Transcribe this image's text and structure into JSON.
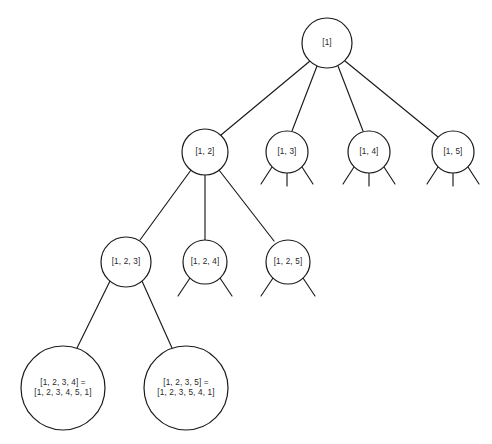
{
  "figure": {
    "type": "tree-diagram",
    "background_color": "#ffffff",
    "stroke_color": "#1a1a1a",
    "text_color": "#272727"
  },
  "nodes": [
    {
      "id": "root",
      "label_lines": [
        "[1]"
      ],
      "line1": "[1]",
      "line2": "",
      "cx": 327,
      "cy": 43,
      "r": 25,
      "level": 0
    },
    {
      "id": "n-1-2",
      "label_lines": [
        "[1, 2]"
      ],
      "line1": "[1, 2]",
      "line2": "",
      "cx": 205,
      "cy": 152,
      "r": 23,
      "level": 1
    },
    {
      "id": "n-1-3",
      "label_lines": [
        "[1, 3]"
      ],
      "line1": "[1, 3]",
      "line2": "",
      "cx": 287,
      "cy": 152,
      "r": 21,
      "level": 1
    },
    {
      "id": "n-1-4",
      "label_lines": [
        "[1, 4]"
      ],
      "line1": "[1, 4]",
      "line2": "",
      "cx": 369,
      "cy": 152,
      "r": 21,
      "level": 1
    },
    {
      "id": "n-1-5",
      "label_lines": [
        "[1, 5]"
      ],
      "line1": "[1, 5]",
      "line2": "",
      "cx": 453,
      "cy": 152,
      "r": 21,
      "level": 1
    },
    {
      "id": "n-1-2-3",
      "label_lines": [
        "[1, 2, 3]"
      ],
      "line1": "[1, 2, 3]",
      "line2": "",
      "cx": 126,
      "cy": 262,
      "r": 25,
      "level": 2
    },
    {
      "id": "n-1-2-4",
      "label_lines": [
        "[1, 2, 4]"
      ],
      "line1": "[1, 2, 4]",
      "line2": "",
      "cx": 205,
      "cy": 262,
      "r": 22,
      "level": 2
    },
    {
      "id": "n-1-2-5",
      "label_lines": [
        "[1, 2, 5]"
      ],
      "line1": "[1, 2, 5]",
      "line2": "",
      "cx": 288,
      "cy": 262,
      "r": 22,
      "level": 2
    },
    {
      "id": "n-1-2-3-4",
      "label_lines": [
        "[1, 2, 3, 4] =",
        "[1, 2, 3, 4, 5, 1]"
      ],
      "line1": "[1, 2, 3, 4] =",
      "line2": "[1, 2, 3, 4, 5, 1]",
      "cx": 63,
      "cy": 388,
      "r": 42,
      "level": 3
    },
    {
      "id": "n-1-2-3-5",
      "label_lines": [
        "[1, 2, 3, 5] =",
        "[1, 2, 3, 5, 4, 1]"
      ],
      "line1": "[1, 2, 3, 5] =",
      "line2": "[1, 2, 3, 5, 4, 1]",
      "cx": 186,
      "cy": 388,
      "r": 42,
      "level": 3
    }
  ],
  "edges": [
    {
      "id": "e-root-12",
      "from": "root",
      "to": "n-1-2",
      "x1": 310,
      "y1": 61,
      "x2": 221,
      "y2": 135
    },
    {
      "id": "e-root-13",
      "from": "root",
      "to": "n-1-3",
      "x1": 317,
      "y1": 66,
      "x2": 292,
      "y2": 131
    },
    {
      "id": "e-root-14",
      "from": "root",
      "to": "n-1-4",
      "x1": 338,
      "y1": 66,
      "x2": 363,
      "y2": 131
    },
    {
      "id": "e-root-15",
      "from": "root",
      "to": "n-1-5",
      "x1": 345,
      "y1": 61,
      "x2": 438,
      "y2": 137
    },
    {
      "id": "e-12-123",
      "from": "n-1-2",
      "to": "n-1-2-3",
      "x1": 191,
      "y1": 170,
      "x2": 140,
      "y2": 240
    },
    {
      "id": "e-12-124",
      "from": "n-1-2",
      "to": "n-1-2-4",
      "x1": 205,
      "y1": 175,
      "x2": 205,
      "y2": 240
    },
    {
      "id": "e-12-125",
      "from": "n-1-2",
      "to": "n-1-2-5",
      "x1": 219,
      "y1": 170,
      "x2": 274,
      "y2": 241
    },
    {
      "id": "e-123-1234",
      "from": "n-1-2-3",
      "to": "n-1-2-3-4",
      "x1": 110,
      "y1": 281,
      "x2": 77,
      "y2": 348
    },
    {
      "id": "e-123-1235",
      "from": "n-1-2-3",
      "to": "n-1-2-3-5",
      "x1": 142,
      "y1": 281,
      "x2": 172,
      "y2": 348
    }
  ],
  "stubs": [
    {
      "id": "s-13-left",
      "node": "n-1-3",
      "x1": 272,
      "y1": 167,
      "x2": 261,
      "y2": 184
    },
    {
      "id": "s-13-mid",
      "node": "n-1-3",
      "x1": 287,
      "y1": 173,
      "x2": 287,
      "y2": 186
    },
    {
      "id": "s-13-right",
      "node": "n-1-3",
      "x1": 302,
      "y1": 167,
      "x2": 313,
      "y2": 184
    },
    {
      "id": "s-14-left",
      "node": "n-1-4",
      "x1": 354,
      "y1": 167,
      "x2": 343,
      "y2": 184
    },
    {
      "id": "s-14-mid",
      "node": "n-1-4",
      "x1": 369,
      "y1": 173,
      "x2": 369,
      "y2": 186
    },
    {
      "id": "s-14-right",
      "node": "n-1-4",
      "x1": 384,
      "y1": 167,
      "x2": 395,
      "y2": 184
    },
    {
      "id": "s-15-left",
      "node": "n-1-5",
      "x1": 438,
      "y1": 167,
      "x2": 427,
      "y2": 184
    },
    {
      "id": "s-15-mid",
      "node": "n-1-5",
      "x1": 453,
      "y1": 173,
      "x2": 453,
      "y2": 186
    },
    {
      "id": "s-15-right",
      "node": "n-1-5",
      "x1": 468,
      "y1": 167,
      "x2": 479,
      "y2": 184
    },
    {
      "id": "s-124-left",
      "node": "n-1-2-4",
      "x1": 190,
      "y1": 278,
      "x2": 178,
      "y2": 296
    },
    {
      "id": "s-124-right",
      "node": "n-1-2-4",
      "x1": 220,
      "y1": 278,
      "x2": 232,
      "y2": 296
    },
    {
      "id": "s-125-left",
      "node": "n-1-2-5",
      "x1": 273,
      "y1": 278,
      "x2": 261,
      "y2": 296
    },
    {
      "id": "s-125-right",
      "node": "n-1-2-5",
      "x1": 303,
      "y1": 278,
      "x2": 315,
      "y2": 296
    }
  ]
}
